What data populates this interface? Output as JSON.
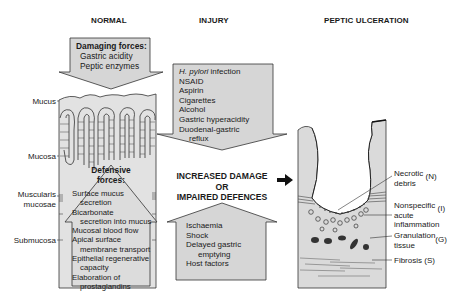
{
  "headers": {
    "normal": "NORMAL",
    "injury": "INJURY",
    "peptic": "PEPTIC ULCERATION"
  },
  "damaging_forces": {
    "title": "Damaging forces:",
    "items": [
      "Gastric acidity",
      "Peptic enzymes"
    ]
  },
  "layers": {
    "mucus": "Mucus",
    "mucosa": "Mucosa",
    "muscularis_1": "Muscularis",
    "muscularis_2": "mucosae",
    "submucosa": "Submucosa"
  },
  "defensive_forces": {
    "title_1": "Defensive",
    "title_2": "forces:",
    "items": [
      "Surface mucus",
      "secretion",
      "Bicarbonate",
      "secretion into mucus",
      "Mucosal blood flow",
      "Apical surface",
      "membrane transport",
      "Epithelial regenerative",
      "capacity",
      "Elaboration of",
      "prostaglandins"
    ]
  },
  "injury_down": {
    "items": [
      {
        "italic": "H. pylori",
        "rest": " infection"
      },
      "NSAID",
      "Aspirin",
      "Cigarettes",
      "Alcohol",
      "Gastric hyperacidity",
      "Duodenal-gastric",
      "reflux"
    ],
    "item0_italic": "H. pylori",
    "item0_rest": " infection"
  },
  "center_text": {
    "line1": "INCREASED DAMAGE",
    "line2": "OR",
    "line3": "IMPAIRED DEFENCES"
  },
  "injury_up": {
    "items": [
      "Ischaemia",
      "Shock",
      "Delayed gastric",
      "emptying",
      "Host factors"
    ]
  },
  "ulcer_labels": {
    "necrotic_1": "Necrotic",
    "necrotic_2": "debris",
    "necrotic_code": "(N)",
    "inflam_1": "Nonspecific",
    "inflam_2": "acute",
    "inflam_3": "inflammation",
    "inflam_code": "(I)",
    "gran_1": "Granulation",
    "gran_2": "tissue",
    "gran_code": "(G)",
    "fibrosis": "Fibrosis (S)"
  },
  "colors": {
    "box_fill": "#d9d9d9",
    "tissue_fill": "#dedede",
    "outline": "#222222",
    "background": "#ffffff"
  }
}
